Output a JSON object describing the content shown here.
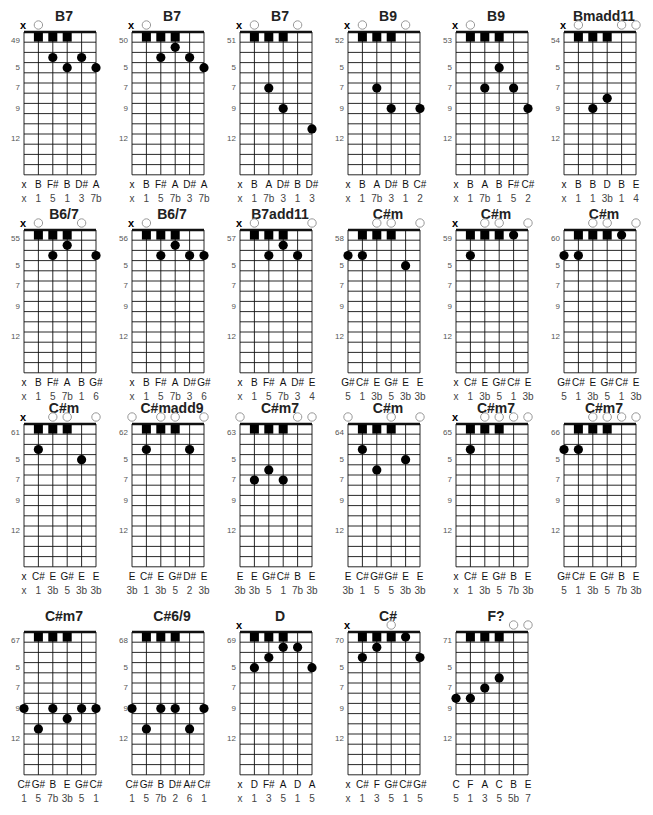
{
  "chart_data": {
    "type": "chord-diagram-sheet",
    "grid": {
      "strings": 6,
      "fret_rows": 14,
      "side_fret_labels": [
        "5",
        "7",
        "9",
        "12"
      ],
      "side_label_rows": [
        4,
        6,
        8,
        11
      ]
    },
    "legend": {
      "x": "muted string",
      "open_circle": "open string",
      "square": "fret-1 row marker",
      "dot": "fretted note"
    }
  },
  "chords": [
    {
      "id": "49",
      "name": "B7",
      "top": [
        "x",
        "o",
        null,
        null,
        null,
        null
      ],
      "squares": [
        2,
        3,
        4
      ],
      "dots": [
        [
          3,
          3
        ],
        [
          4,
          4
        ],
        [
          5,
          3
        ],
        [
          6,
          4
        ]
      ],
      "notes": [
        "x",
        "B",
        "F#",
        "B",
        "D#",
        "A"
      ],
      "degrees": [
        "x",
        "1",
        "5",
        "1",
        "3",
        "7b"
      ]
    },
    {
      "id": "50",
      "name": "B7",
      "top": [
        "x",
        "o",
        null,
        null,
        null,
        null
      ],
      "squares": [
        2,
        3,
        4
      ],
      "dots": [
        [
          4,
          2
        ],
        [
          3,
          3
        ],
        [
          5,
          3
        ],
        [
          6,
          4
        ]
      ],
      "notes": [
        "x",
        "B",
        "F#",
        "A",
        "D#",
        "A"
      ],
      "degrees": [
        "x",
        "1",
        "5",
        "7b",
        "3",
        "7b"
      ]
    },
    {
      "id": "51",
      "name": "B7",
      "top": [
        "x",
        "o",
        null,
        null,
        "o",
        null
      ],
      "squares": [
        2,
        3,
        4
      ],
      "dots": [
        [
          3,
          6
        ],
        [
          4,
          8
        ],
        [
          6,
          10
        ]
      ],
      "notes": [
        "x",
        "B",
        "A",
        "D#",
        "B",
        "D#"
      ],
      "degrees": [
        "x",
        "1",
        "7b",
        "3",
        "1",
        "3"
      ]
    },
    {
      "id": "52",
      "name": "B9",
      "top": [
        "x",
        "o",
        null,
        null,
        "o",
        null
      ],
      "squares": [
        2,
        3,
        4
      ],
      "dots": [
        [
          3,
          6
        ],
        [
          4,
          8
        ],
        [
          6,
          8
        ]
      ],
      "notes": [
        "x",
        "B",
        "A",
        "D#",
        "B",
        "C#"
      ],
      "degrees": [
        "x",
        "1",
        "7b",
        "3",
        "1",
        "2"
      ]
    },
    {
      "id": "53",
      "name": "B9",
      "top": [
        "x",
        "o",
        null,
        null,
        null,
        null
      ],
      "squares": [
        2,
        3,
        4
      ],
      "dots": [
        [
          4,
          4
        ],
        [
          3,
          6
        ],
        [
          5,
          6
        ],
        [
          6,
          8
        ]
      ],
      "notes": [
        "x",
        "B",
        "A",
        "B",
        "F#",
        "C#"
      ],
      "degrees": [
        "x",
        "1",
        "7b",
        "1",
        "5",
        "2"
      ]
    },
    {
      "id": "54",
      "name": "Bmadd11",
      "top": [
        "x",
        "o",
        null,
        null,
        "o",
        "o"
      ],
      "squares": [
        2,
        3,
        4
      ],
      "dots": [
        [
          4,
          7
        ],
        [
          3,
          8
        ]
      ],
      "notes": [
        "x",
        "B",
        "B",
        "D",
        "B",
        "E"
      ],
      "degrees": [
        "x",
        "1",
        "1",
        "3b",
        "1",
        "4"
      ]
    },
    {
      "id": "55",
      "name": "B6/7",
      "top": [
        "x",
        "o",
        null,
        null,
        "o",
        null
      ],
      "squares": [
        2,
        3,
        4
      ],
      "dots": [
        [
          4,
          2
        ],
        [
          3,
          3
        ],
        [
          6,
          3
        ]
      ],
      "notes": [
        "x",
        "B",
        "F#",
        "A",
        "B",
        "G#"
      ],
      "degrees": [
        "x",
        "1",
        "5",
        "7b",
        "1",
        "6"
      ]
    },
    {
      "id": "56",
      "name": "B6/7",
      "top": [
        "x",
        "o",
        null,
        null,
        null,
        null
      ],
      "squares": [
        2,
        3,
        4
      ],
      "dots": [
        [
          4,
          2
        ],
        [
          3,
          3
        ],
        [
          5,
          3
        ],
        [
          6,
          3
        ]
      ],
      "notes": [
        "x",
        "B",
        "F#",
        "A",
        "D#",
        "G#"
      ],
      "degrees": [
        "x",
        "1",
        "5",
        "7b",
        "3",
        "6"
      ]
    },
    {
      "id": "57",
      "name": "B7add11",
      "top": [
        "x",
        "o",
        null,
        null,
        null,
        "o"
      ],
      "squares": [
        2,
        3,
        4
      ],
      "dots": [
        [
          4,
          2
        ],
        [
          3,
          3
        ],
        [
          5,
          3
        ]
      ],
      "notes": [
        "x",
        "B",
        "F#",
        "A",
        "D#",
        "E"
      ],
      "degrees": [
        "x",
        "1",
        "5",
        "7b",
        "3",
        "4"
      ]
    },
    {
      "id": "58",
      "name": "C#m",
      "top": [
        null,
        null,
        "o",
        "o",
        null,
        "o"
      ],
      "squares": [
        2,
        3,
        4
      ],
      "dots": [
        [
          1,
          3
        ],
        [
          2,
          3
        ],
        [
          5,
          4
        ]
      ],
      "notes": [
        "G#",
        "C#",
        "E",
        "G#",
        "E",
        "E"
      ],
      "degrees": [
        "5",
        "1",
        "3b",
        "5",
        "3b",
        "3b"
      ]
    },
    {
      "id": "59",
      "name": "C#m",
      "top": [
        "x",
        null,
        "o",
        "o",
        null,
        "o"
      ],
      "squares": [
        2,
        3,
        4
      ],
      "dots": [
        [
          5,
          1
        ],
        [
          2,
          3
        ]
      ],
      "notes": [
        "x",
        "C#",
        "E",
        "G#",
        "C#",
        "E"
      ],
      "degrees": [
        "x",
        "1",
        "3b",
        "5",
        "1",
        "3b"
      ]
    },
    {
      "id": "60",
      "name": "C#m",
      "top": [
        null,
        null,
        "o",
        "o",
        null,
        "o"
      ],
      "squares": [
        2,
        3,
        4
      ],
      "dots": [
        [
          5,
          1
        ],
        [
          1,
          3
        ],
        [
          2,
          3
        ]
      ],
      "notes": [
        "G#",
        "C#",
        "E",
        "G#",
        "C#",
        "E"
      ],
      "degrees": [
        "5",
        "1",
        "3b",
        "5",
        "1",
        "3b"
      ]
    },
    {
      "id": "61",
      "name": "C#m",
      "top": [
        "x",
        null,
        "o",
        "o",
        null,
        "o"
      ],
      "squares": [
        2,
        3,
        4
      ],
      "dots": [
        [
          2,
          3
        ],
        [
          5,
          4
        ]
      ],
      "notes": [
        "x",
        "C#",
        "E",
        "G#",
        "E",
        "E"
      ],
      "degrees": [
        "x",
        "1",
        "3b",
        "5",
        "3b",
        "3b"
      ]
    },
    {
      "id": "62",
      "name": "C#madd9",
      "top": [
        "o",
        null,
        "o",
        "o",
        null,
        "o"
      ],
      "squares": [
        2,
        3,
        4
      ],
      "dots": [
        [
          2,
          3
        ],
        [
          5,
          3
        ]
      ],
      "notes": [
        "E",
        "C#",
        "E",
        "G#",
        "D#",
        "E"
      ],
      "degrees": [
        "3b",
        "1",
        "3b",
        "5",
        "2",
        "3b"
      ]
    },
    {
      "id": "63",
      "name": "C#m7",
      "top": [
        "o",
        null,
        null,
        null,
        "o",
        "o"
      ],
      "squares": [
        2,
        3,
        4
      ],
      "dots": [
        [
          3,
          5
        ],
        [
          2,
          6
        ],
        [
          4,
          6
        ]
      ],
      "notes": [
        "E",
        "E",
        "G#",
        "C#",
        "B",
        "E"
      ],
      "degrees": [
        "3b",
        "3b",
        "5",
        "1",
        "7b",
        "3b"
      ]
    },
    {
      "id": "64",
      "name": "C#m",
      "top": [
        "o",
        null,
        null,
        "o",
        null,
        "o"
      ],
      "squares": [
        2,
        3,
        4
      ],
      "dots": [
        [
          2,
          3
        ],
        [
          5,
          4
        ],
        [
          3,
          5
        ]
      ],
      "notes": [
        "E",
        "C#",
        "G#",
        "G#",
        "E",
        "E"
      ],
      "degrees": [
        "3b",
        "1",
        "5",
        "5",
        "3b",
        "3b"
      ]
    },
    {
      "id": "65",
      "name": "C#m7",
      "top": [
        "x",
        null,
        "o",
        "o",
        "o",
        "o"
      ],
      "squares": [
        2,
        3,
        4
      ],
      "dots": [
        [
          2,
          3
        ]
      ],
      "notes": [
        "x",
        "C#",
        "E",
        "G#",
        "B",
        "E"
      ],
      "degrees": [
        "x",
        "1",
        "3b",
        "5",
        "7b",
        "3b"
      ]
    },
    {
      "id": "66",
      "name": "C#m7",
      "top": [
        null,
        null,
        "o",
        "o",
        "o",
        "o"
      ],
      "squares": [
        2,
        3,
        4
      ],
      "dots": [
        [
          1,
          3
        ],
        [
          2,
          3
        ]
      ],
      "notes": [
        "G#",
        "C#",
        "E",
        "G#",
        "B",
        "E"
      ],
      "degrees": [
        "5",
        "1",
        "3b",
        "5",
        "7b",
        "3b"
      ]
    },
    {
      "id": "67",
      "name": "C#m7",
      "top": [
        null,
        null,
        null,
        null,
        null,
        null
      ],
      "squares": [
        2,
        3,
        4
      ],
      "dots": [
        [
          1,
          8
        ],
        [
          3,
          8
        ],
        [
          5,
          8
        ],
        [
          6,
          8
        ],
        [
          4,
          9
        ],
        [
          2,
          10
        ]
      ],
      "notes": [
        "C#",
        "G#",
        "B",
        "E",
        "G#",
        "C#"
      ],
      "degrees": [
        "1",
        "5",
        "7b",
        "3b",
        "5",
        "1"
      ]
    },
    {
      "id": "68",
      "name": "C#6/9",
      "top": [
        null,
        null,
        null,
        null,
        null,
        null
      ],
      "squares": [
        2,
        3,
        4
      ],
      "dots": [
        [
          1,
          8
        ],
        [
          3,
          8
        ],
        [
          4,
          8
        ],
        [
          6,
          8
        ],
        [
          2,
          10
        ],
        [
          5,
          10
        ]
      ],
      "notes": [
        "C#",
        "G#",
        "B",
        "D#",
        "A#",
        "C#"
      ],
      "degrees": [
        "1",
        "5",
        "7b",
        "2",
        "6",
        "1"
      ]
    },
    {
      "id": "69",
      "name": "D",
      "top": [
        "x",
        null,
        null,
        null,
        null,
        null
      ],
      "squares": [
        2,
        3,
        4
      ],
      "dots": [
        [
          4,
          2
        ],
        [
          5,
          2
        ],
        [
          3,
          3
        ],
        [
          2,
          4
        ],
        [
          6,
          4
        ]
      ],
      "notes": [
        "x",
        "D",
        "F#",
        "A",
        "D",
        "A"
      ],
      "degrees": [
        "x",
        "1",
        "3",
        "5",
        "1",
        "5"
      ]
    },
    {
      "id": "70",
      "name": "C#",
      "top": [
        "x",
        null,
        null,
        "o",
        null,
        null
      ],
      "squares": [
        2,
        3,
        4
      ],
      "dots": [
        [
          5,
          1
        ],
        [
          3,
          2
        ],
        [
          2,
          3
        ],
        [
          6,
          3
        ]
      ],
      "notes": [
        "x",
        "C#",
        "F",
        "G#",
        "C#",
        "G#"
      ],
      "degrees": [
        "x",
        "1",
        "3",
        "5",
        "1",
        "5"
      ]
    },
    {
      "id": "71",
      "name": "F?",
      "top": [
        null,
        null,
        null,
        null,
        "o",
        "o"
      ],
      "squares": [
        2,
        3,
        4
      ],
      "dots": [
        [
          4,
          5
        ],
        [
          3,
          6
        ],
        [
          1,
          7
        ],
        [
          2,
          7
        ]
      ],
      "notes": [
        "C",
        "F",
        "A",
        "C",
        "B",
        "E"
      ],
      "degrees": [
        "5",
        "1",
        "3",
        "5",
        "5b",
        "7"
      ]
    }
  ],
  "layout": {
    "col_x": [
      10,
      118,
      226,
      334,
      442,
      550
    ],
    "row_y": [
      0,
      198,
      392,
      600
    ]
  }
}
